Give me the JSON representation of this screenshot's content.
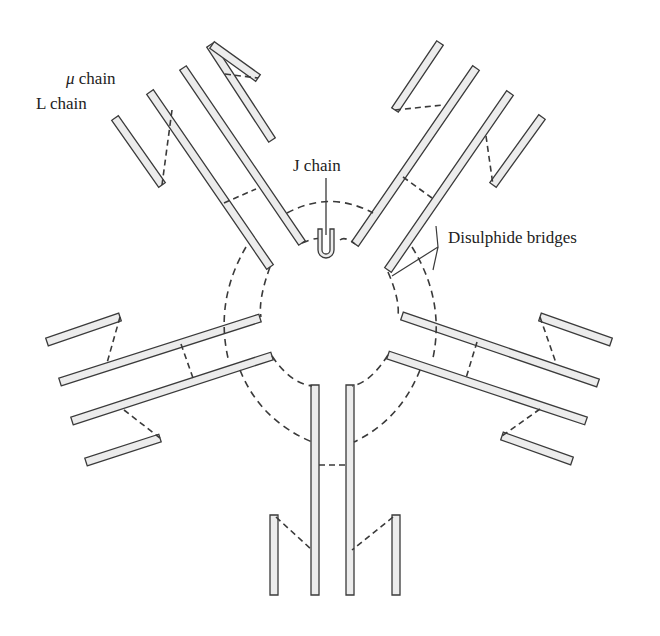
{
  "labels": {
    "mu_chain_symbol": "μ",
    "mu_chain_text": " chain",
    "l_chain": "L chain",
    "j_chain": "J chain",
    "disulphide": "Disulphide bridges"
  },
  "colors": {
    "stroke": "#3a3a3a",
    "fill": "#ececec",
    "background": "#ffffff"
  },
  "bars": [
    {
      "id": "ul-heavy-outer",
      "x1": 210,
      "y1": 45,
      "x2": 272,
      "y2": 140
    },
    {
      "id": "ul-light-outer",
      "x1": 212,
      "y1": 45,
      "x2": 258,
      "y2": 78
    },
    {
      "id": "ul-heavy-a",
      "x1": 183,
      "y1": 68,
      "x2": 302,
      "y2": 243
    },
    {
      "id": "ul-heavy-b",
      "x1": 150,
      "y1": 92,
      "x2": 270,
      "y2": 267
    },
    {
      "id": "ul-light-inner",
      "x1": 115,
      "y1": 118,
      "x2": 162,
      "y2": 185
    },
    {
      "id": "ur-light-outer",
      "x1": 440,
      "y1": 43,
      "x2": 395,
      "y2": 110
    },
    {
      "id": "ur-heavy-a",
      "x1": 476,
      "y1": 68,
      "x2": 355,
      "y2": 244
    },
    {
      "id": "ur-heavy-b",
      "x1": 510,
      "y1": 93,
      "x2": 388,
      "y2": 270
    },
    {
      "id": "ur-light-inner",
      "x1": 542,
      "y1": 117,
      "x2": 493,
      "y2": 185
    },
    {
      "id": "l-light-outer",
      "x1": 47,
      "y1": 342,
      "x2": 120,
      "y2": 317
    },
    {
      "id": "l-heavy-a",
      "x1": 60,
      "y1": 382,
      "x2": 260,
      "y2": 318
    },
    {
      "id": "l-heavy-b",
      "x1": 72,
      "y1": 421,
      "x2": 272,
      "y2": 356
    },
    {
      "id": "l-light-inner",
      "x1": 86,
      "y1": 462,
      "x2": 160,
      "y2": 438
    },
    {
      "id": "r-light-outer",
      "x1": 611,
      "y1": 342,
      "x2": 540,
      "y2": 317
    },
    {
      "id": "r-heavy-a",
      "x1": 598,
      "y1": 383,
      "x2": 402,
      "y2": 316
    },
    {
      "id": "r-heavy-b",
      "x1": 586,
      "y1": 421,
      "x2": 388,
      "y2": 355
    },
    {
      "id": "r-light-inner",
      "x1": 572,
      "y1": 461,
      "x2": 502,
      "y2": 436
    },
    {
      "id": "b-heavy-a",
      "x1": 315,
      "y1": 385,
      "x2": 315,
      "y2": 595
    },
    {
      "id": "b-heavy-b",
      "x1": 350,
      "y1": 385,
      "x2": 350,
      "y2": 595
    },
    {
      "id": "b-light-left",
      "x1": 274,
      "y1": 515,
      "x2": 274,
      "y2": 595
    },
    {
      "id": "b-light-right",
      "x1": 396,
      "y1": 515,
      "x2": 396,
      "y2": 595
    }
  ],
  "bridges": [
    {
      "id": "ul-outer-bridge",
      "points": "225,74 258,78"
    },
    {
      "id": "ul-inner-bridge",
      "points": "172,110 162,185"
    },
    {
      "id": "ul-hh-bridge",
      "points": "224,203 256,189"
    },
    {
      "id": "ur-outer-bridge",
      "points": "395,110 443,105"
    },
    {
      "id": "ur-inner-bridge",
      "points": "486,136 493,185"
    },
    {
      "id": "ur-hh-bridge",
      "points": "403,177 432,198"
    },
    {
      "id": "l-outer-bridge",
      "points": "120,317 107,363"
    },
    {
      "id": "l-hh-bridge",
      "points": "181,344 193,378"
    },
    {
      "id": "l-inner-bridge",
      "points": "124,410 160,438"
    },
    {
      "id": "r-outer-bridge",
      "points": "540,317 556,363"
    },
    {
      "id": "r-hh-bridge",
      "points": "477,342 466,378"
    },
    {
      "id": "r-inner-bridge",
      "points": "540,409 502,436"
    },
    {
      "id": "b-hh-bridge",
      "points": "319,465 346,465"
    },
    {
      "id": "b-left-bridge",
      "points": "276,517 312,550"
    },
    {
      "id": "b-right-bridge",
      "points": "393,517 352,550"
    }
  ],
  "arcs": [
    {
      "id": "top-arc",
      "d": "M 287,213 Q 330,190 373,213"
    },
    {
      "id": "top-inner-arc",
      "d": "M 302,243 Q 318,236 322,240 M 340,240 Q 345,236 355,244"
    },
    {
      "id": "ul-left-arc",
      "d": "M 246,247 Q 215,300 228,358"
    },
    {
      "id": "ul-right-arc",
      "d": "M 270,267 Q 258,300 261,317"
    },
    {
      "id": "ur-right-arc",
      "d": "M 412,247 Q 445,300 433,358"
    },
    {
      "id": "ur-left-arc",
      "d": "M 388,272 Q 400,300 398,316"
    },
    {
      "id": "bl-outer-arc",
      "d": "M 240,370 Q 260,420 312,442"
    },
    {
      "id": "bl-inner-arc",
      "d": "M 272,356 Q 290,383 312,386"
    },
    {
      "id": "br-outer-arc",
      "d": "M 420,370 Q 400,420 354,442"
    },
    {
      "id": "br-inner-arc",
      "d": "M 388,355 Q 370,383 352,386"
    }
  ],
  "j_chain": {
    "stem_x": 326,
    "stem_y1": 178,
    "stem_y2": 238,
    "u_top": 229,
    "u_bottom": 258
  },
  "disulphide_arrows": [
    {
      "points": "392,276 438,247 436,226"
    },
    {
      "points": "438,247 433,270"
    }
  ]
}
